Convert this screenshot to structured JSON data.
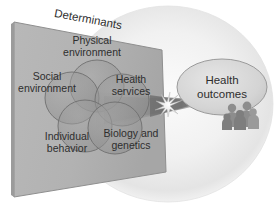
{
  "diagram": {
    "plane_label": "Determinants",
    "outcome_label_line1": "Health",
    "outcome_label_line2": "outcomes",
    "arrow_icon": "converging-arrow-with-starburst",
    "people_icon": "group-of-people-icon",
    "sphere_icon": "background-sphere",
    "determinants": [
      {
        "id": "physical-environment",
        "line1": "Physical",
        "line2": "environment",
        "cx": 97,
        "cy": 86,
        "rx": 27,
        "ry": 26,
        "label_x": 92,
        "label_y": 43
      },
      {
        "id": "social-environment",
        "line1": "Social",
        "line2": "environment",
        "cx": 72,
        "cy": 98,
        "rx": 27,
        "ry": 26,
        "label_x": 50,
        "label_y": 79
      },
      {
        "id": "health-services",
        "line1": "Health",
        "line2": "services",
        "cx": 122,
        "cy": 100,
        "rx": 27,
        "ry": 26,
        "label_x": 129,
        "label_y": 82
      },
      {
        "id": "individual-behavior",
        "line1": "Individual",
        "line2": "behavior",
        "cx": 85,
        "cy": 126,
        "rx": 27,
        "ry": 26,
        "label_x": 68,
        "label_y": 139
      },
      {
        "id": "biology-and-genetics",
        "line1": "Biology and",
        "line2": "genetics",
        "cx": 115,
        "cy": 128,
        "rx": 27,
        "ry": 26,
        "label_x": 130,
        "label_y": 137
      }
    ],
    "colors": {
      "plane_fill": "#b0b0b0",
      "plane_edge": "#8a8a8a",
      "circle_fill": "#9a9a9a",
      "circle_stroke": "#6f6f6f",
      "sphere_fill": "#ededed",
      "outcome_fill": "#d8d8d8",
      "outcome_stroke": "#9a9a9a",
      "text": "#2e2e2e",
      "people": "#8f8f8f",
      "beam": "#9d9d9d"
    },
    "plane_geometry": {
      "top_left_x": 14,
      "top_left_y": 22,
      "top_right_x": 162,
      "top_right_y": 50,
      "bottom_right_x": 166,
      "bottom_right_y": 172,
      "bottom_left_x": 14,
      "bottom_left_y": 197
    }
  }
}
